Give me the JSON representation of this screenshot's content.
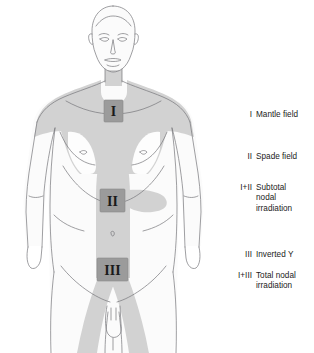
{
  "figure": {
    "alt_name": "anterior-human-torso-radiotherapy-fields",
    "background_color": "#ffffff",
    "outline_color": "#6f6f72",
    "body_fill_color": "#fbfbfb",
    "field_shade_color": "#d2d2d2",
    "field_shade_color_light": "#dedede",
    "lung_cutout_color": "#fdfdfd",
    "marker_box_fill": "#9b9b9b",
    "marker_box_border": "#8a8a8a",
    "marker_glyph_color": "#1a1a1a"
  },
  "markers": [
    {
      "id": "marker-I",
      "numeral": "I",
      "x": 104,
      "y": 100,
      "w": 19,
      "h": 22
    },
    {
      "id": "marker-II",
      "numeral": "II",
      "x": 100,
      "y": 189,
      "w": 25,
      "h": 23
    },
    {
      "id": "marker-III",
      "numeral": "III",
      "x": 97,
      "y": 258,
      "w": 31,
      "h": 23
    }
  ],
  "legend": {
    "entries": [
      {
        "key": "I",
        "label": "Mantle field",
        "top": 110
      },
      {
        "key": "II",
        "label": "Spade field",
        "top": 152
      },
      {
        "key": "I+II",
        "label": "Subtotal\nnodal\nirradiation",
        "top": 183
      },
      {
        "key": "III",
        "label": "Inverted Y",
        "top": 250
      },
      {
        "key": "I+III",
        "label": "Total nodal\nirradiation",
        "top": 271
      }
    ]
  }
}
